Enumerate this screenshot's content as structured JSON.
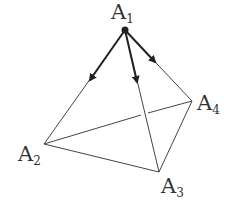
{
  "diagram": {
    "type": "tetrahedron",
    "vertices": [
      {
        "id": "A1",
        "label": "A",
        "sub": "1",
        "x": 125,
        "y": 30
      },
      {
        "id": "A2",
        "label": "A",
        "sub": "2",
        "x": 44,
        "y": 144
      },
      {
        "id": "A3",
        "label": "A",
        "sub": "3",
        "x": 159,
        "y": 172
      },
      {
        "id": "A4",
        "label": "A",
        "sub": "4",
        "x": 192,
        "y": 101
      }
    ],
    "edges": [
      "A1-A2",
      "A1-A3",
      "A1-A4",
      "A2-A3",
      "A3-A4",
      "A2-A4 (hidden, behind A1-A3)"
    ],
    "vectors": [
      {
        "from": "A1",
        "toward": "A2"
      },
      {
        "from": "A1",
        "toward": "A3"
      },
      {
        "from": "A1",
        "toward": "A4"
      }
    ],
    "line_color": "#333333"
  }
}
